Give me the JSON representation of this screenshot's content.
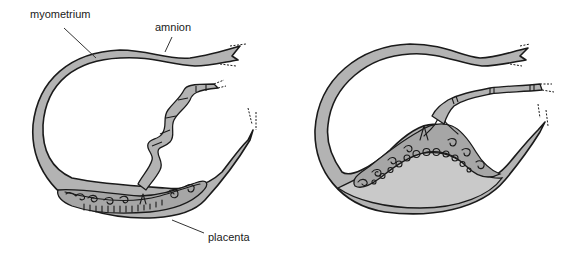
{
  "figure": {
    "type": "anatomical-diagram",
    "panels": [
      {
        "id": "left",
        "description": "Uterus cross-section with umbilical cord coiled and placenta along lower wall",
        "labels": [
          {
            "text": "myometrium",
            "x": 30,
            "y": 18
          },
          {
            "text": "amnion",
            "x": 155,
            "y": 31
          },
          {
            "text": "placenta",
            "x": 208,
            "y": 238
          }
        ]
      },
      {
        "id": "right",
        "description": "Uterus cross-section with placenta bulging upward and fluid-filled space beneath",
        "labels": []
      }
    ],
    "colors": {
      "tissue": "#b3b3b3",
      "placenta": "#a6a6a6",
      "fluid": "#c9c9c9",
      "outline": "#1a1a1a",
      "background": "#ffffff"
    }
  }
}
